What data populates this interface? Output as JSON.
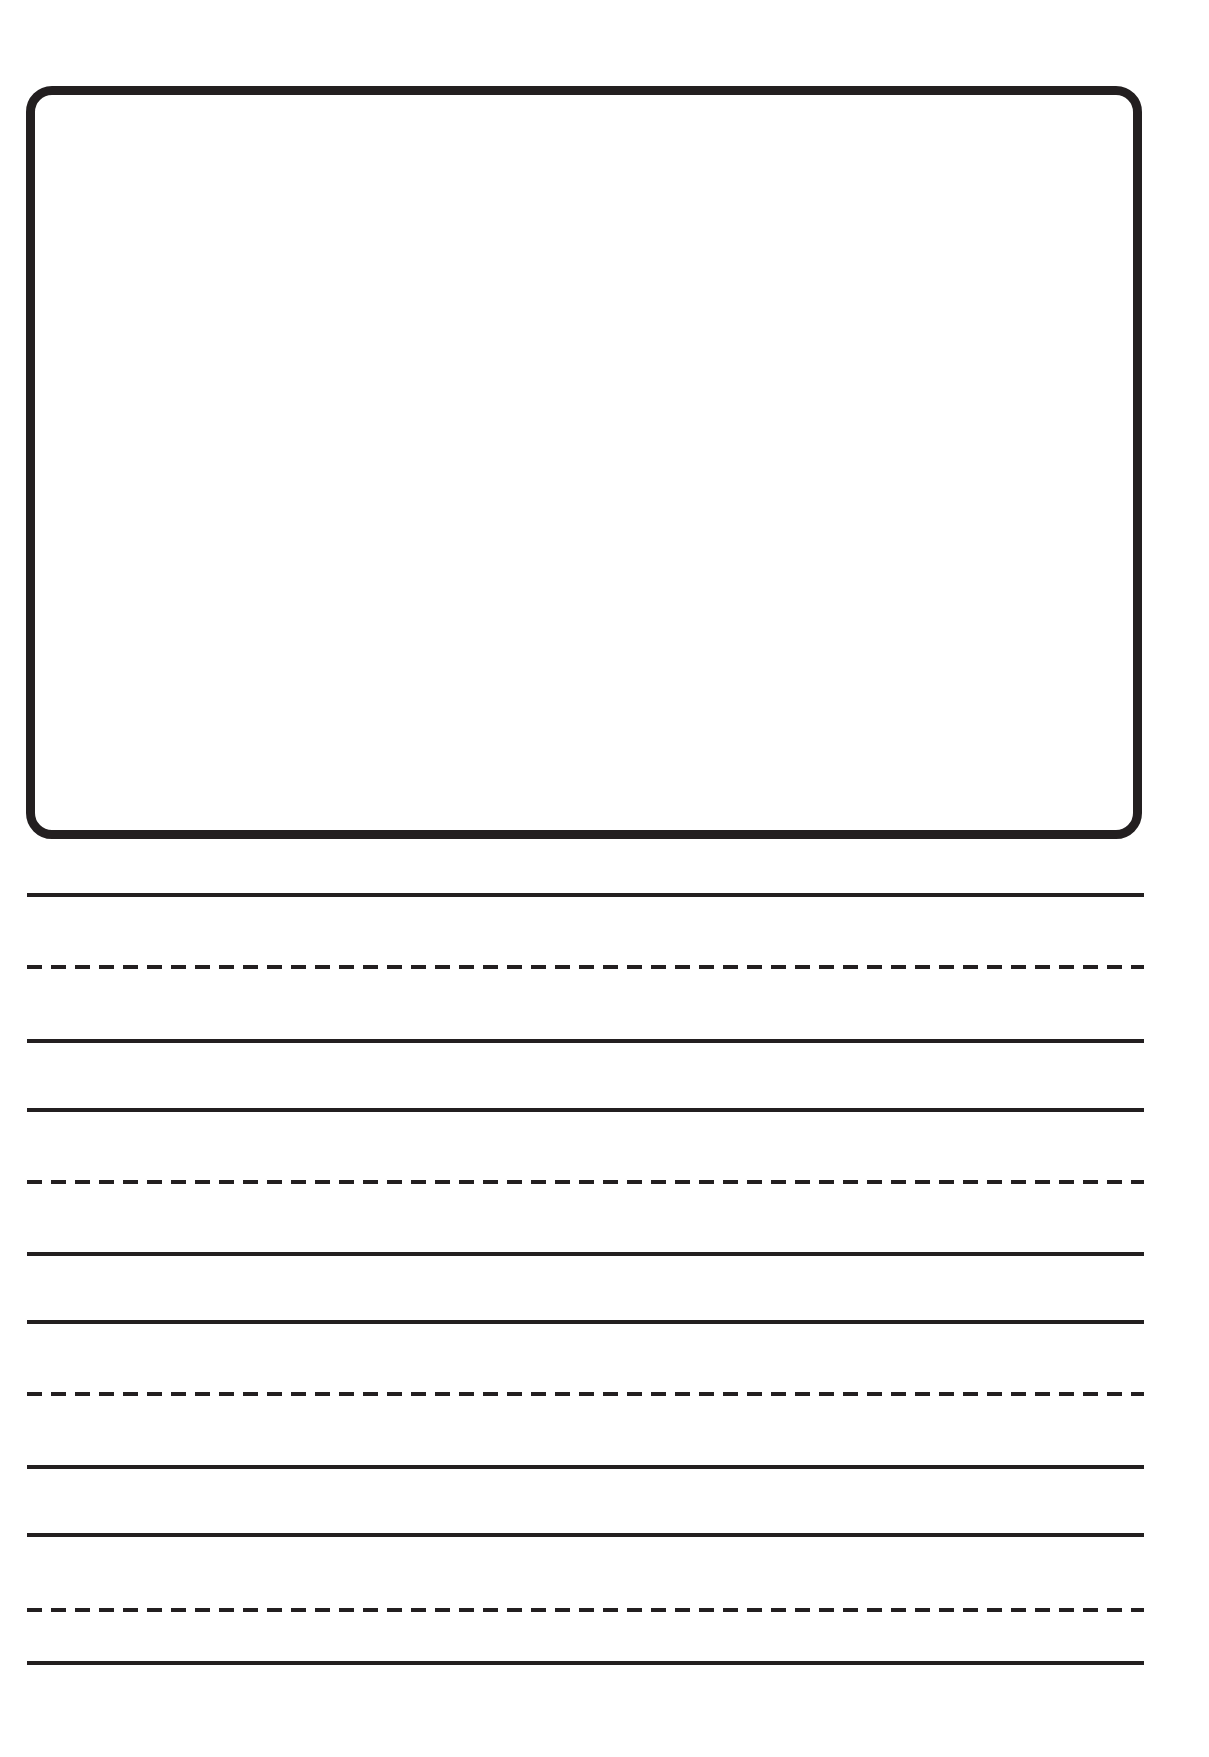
{
  "page": {
    "background_color": "#ffffff",
    "ink_color": "#231f20",
    "width": 1209,
    "height": 1757
  },
  "drawing_box": {
    "name": "picture-box",
    "label": "",
    "border_color": "#231f20",
    "border_width_px": 9,
    "corner_radius_px": 26,
    "x": 26,
    "y": 86,
    "width": 1116,
    "height": 753,
    "fill": "#ffffff"
  },
  "writing_lines": {
    "left_x": 27,
    "right_x": 1144,
    "line_thickness_px": 4,
    "dash_length_px": 15,
    "dash_gap_px": 9,
    "rows": [
      {
        "name": "writing-row-1",
        "top_line_y": 895,
        "mid_line_y": 967,
        "bottom_line_y": 1041,
        "text": ""
      },
      {
        "name": "writing-row-2",
        "top_line_y": 1110,
        "mid_line_y": 1182,
        "bottom_line_y": 1254,
        "text": ""
      },
      {
        "name": "writing-row-3",
        "top_line_y": 1322,
        "mid_line_y": 1394,
        "bottom_line_y": 1467,
        "text": ""
      },
      {
        "name": "writing-row-4",
        "top_line_y": 1535,
        "mid_line_y": 1610,
        "bottom_line_y": 1663,
        "text": ""
      }
    ],
    "all_lines": [
      {
        "type": "solid",
        "y": 895
      },
      {
        "type": "dashed",
        "y": 967
      },
      {
        "type": "solid",
        "y": 1041
      },
      {
        "type": "solid",
        "y": 1110
      },
      {
        "type": "dashed",
        "y": 1182
      },
      {
        "type": "solid",
        "y": 1254
      },
      {
        "type": "solid",
        "y": 1322
      },
      {
        "type": "dashed",
        "y": 1394
      },
      {
        "type": "solid",
        "y": 1467
      },
      {
        "type": "solid",
        "y": 1535
      },
      {
        "type": "dashed",
        "y": 1610
      },
      {
        "type": "solid",
        "y": 1663
      }
    ]
  }
}
